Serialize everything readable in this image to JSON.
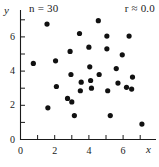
{
  "figure": {
    "title": "",
    "n_label": "n = 30",
    "r_label": "r ≈ 0.0",
    "x_axis_name": "x",
    "y_axis_name": "y"
  },
  "chart_data": {
    "type": "scatter",
    "title": "",
    "subtitle": "",
    "xlabel": "x",
    "ylabel": "y",
    "xlim": [
      0,
      7.4
    ],
    "ylim": [
      0,
      7.4
    ],
    "grid": false,
    "legend": "none",
    "annotations": [
      {
        "name": "sample-size",
        "text": "n = 30",
        "position": "top-left"
      },
      {
        "name": "correlation",
        "text": "r ≈ 0.0",
        "position": "top-right"
      }
    ],
    "x_ticks_major": [
      0,
      2,
      4,
      6
    ],
    "x_ticks_minor": [
      1,
      3,
      5,
      7
    ],
    "y_ticks_major": [
      0,
      2,
      4,
      6
    ],
    "y_ticks_minor": [
      1,
      3,
      5,
      7
    ],
    "x_tick_labels": [
      "0",
      "2",
      "4",
      "6"
    ],
    "y_tick_labels": [
      "0",
      "2",
      "4",
      "6"
    ],
    "marker": {
      "shape": "circle",
      "color": "#111111",
      "size": 4
    },
    "n": 30,
    "r": 0.0,
    "points": [
      {
        "x": 0.75,
        "y": 4.45
      },
      {
        "x": 1.55,
        "y": 6.75
      },
      {
        "x": 1.6,
        "y": 1.85
      },
      {
        "x": 2.05,
        "y": 4.6
      },
      {
        "x": 2.1,
        "y": 3.1
      },
      {
        "x": 2.75,
        "y": 2.4
      },
      {
        "x": 2.9,
        "y": 5.15
      },
      {
        "x": 2.95,
        "y": 3.8
      },
      {
        "x": 3.0,
        "y": 2.2
      },
      {
        "x": 3.15,
        "y": 1.4
      },
      {
        "x": 3.45,
        "y": 6.2
      },
      {
        "x": 3.5,
        "y": 2.85
      },
      {
        "x": 3.55,
        "y": 3.35
      },
      {
        "x": 4.0,
        "y": 5.4
      },
      {
        "x": 4.05,
        "y": 4.25
      },
      {
        "x": 4.1,
        "y": 3.45
      },
      {
        "x": 4.15,
        "y": 3.0
      },
      {
        "x": 4.55,
        "y": 6.95
      },
      {
        "x": 4.6,
        "y": 3.8
      },
      {
        "x": 5.05,
        "y": 6.05
      },
      {
        "x": 5.05,
        "y": 5.3
      },
      {
        "x": 5.1,
        "y": 2.85
      },
      {
        "x": 5.25,
        "y": 1.4
      },
      {
        "x": 5.6,
        "y": 4.15
      },
      {
        "x": 5.7,
        "y": 3.3
      },
      {
        "x": 5.95,
        "y": 4.95
      },
      {
        "x": 6.2,
        "y": 3.05
      },
      {
        "x": 6.35,
        "y": 6.05
      },
      {
        "x": 6.5,
        "y": 2.95
      },
      {
        "x": 6.55,
        "y": 3.65
      },
      {
        "x": 7.1,
        "y": 0.9
      }
    ]
  }
}
